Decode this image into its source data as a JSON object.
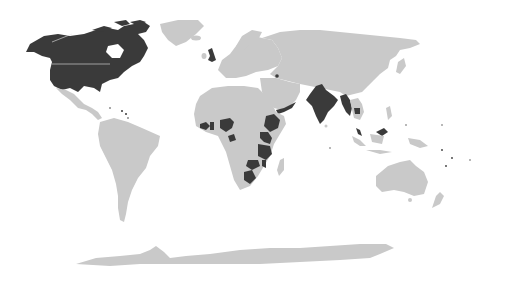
{
  "map": {
    "type": "world-choropleth",
    "projection": "equirectangular-like",
    "colors": {
      "background": "#ffffff",
      "land": "#c9c9c9",
      "highlighted": "#3a3a3a"
    },
    "highlighted_countries": [
      "United States",
      "Canada",
      "United Kingdom",
      "Armenia",
      "India",
      "Bangladesh",
      "Myanmar",
      "Cambodia",
      "Malaysia",
      "Nigeria",
      "Ghana",
      "Sierra Leone",
      "Liberia",
      "Cameroon",
      "Ethiopia",
      "Yemen",
      "Uganda",
      "Kenya",
      "Rwanda",
      "Tanzania",
      "Malawi",
      "Zambia",
      "Botswana",
      "Caribbean islands",
      "Pacific islands"
    ]
  }
}
